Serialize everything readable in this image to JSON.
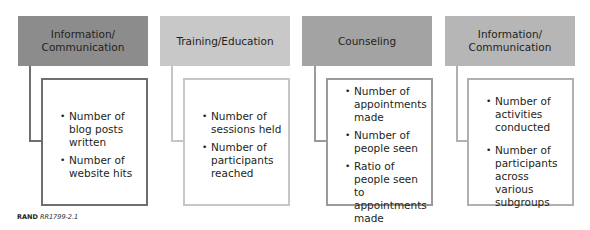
{
  "columns": [
    {
      "title": "Information/ Communication",
      "title_lines": [
        "Information/",
        "Communication"
      ],
      "header_color": "#8c8c8c",
      "border_color": "#6e6e6e",
      "items": [
        "Number of blog posts written",
        "Number of website hits"
      ]
    },
    {
      "title": "Training/Education",
      "title_lines": [
        "Training/Education"
      ],
      "header_color": "#c8c8c8",
      "border_color": "#c6c6c6",
      "items": [
        "Number of sessions held",
        "Number of participants reached"
      ]
    },
    {
      "title": "Counseling",
      "title_lines": [
        "Counseling"
      ],
      "header_color": "#a3a3a3",
      "border_color": "#9a9a9a",
      "items": [
        "Number of appointments made",
        "Number of people seen",
        "Ratio of people seen to appointments made"
      ]
    },
    {
      "title": "Information/ Communication",
      "title_lines": [
        "Information/",
        "Communication"
      ],
      "header_color": "#b6b6b6",
      "border_color": "#b0b0b0",
      "items": [
        "Number of activities conducted",
        "Number of participants across various subgroups"
      ]
    }
  ],
  "footer": {
    "org": "RAND",
    "figure_id": "RR1799-2.1"
  }
}
